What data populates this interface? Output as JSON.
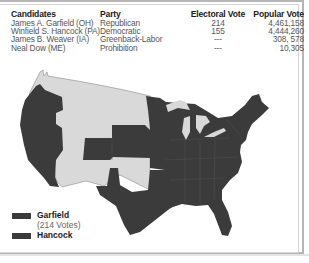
{
  "table": {
    "headers": [
      "Candidates",
      "Party",
      "Electoral Vote",
      "Popular Vote"
    ],
    "rows": [
      {
        "candidate": "James A. Garfield (OH)",
        "party": "Republican",
        "electoral_vote": "214",
        "popular_vote": "4,461,158"
      },
      {
        "candidate": "Winfield S. Hancock (PA)",
        "party": "Democratic",
        "electoral_vote": "155",
        "popular_vote": "4,444,260"
      },
      {
        "candidate": "James B. Weaver (IA)",
        "party": "Greenback-Labor",
        "electoral_vote": "---",
        "popular_vote": "308, 578"
      },
      {
        "candidate": "Neal Dow (ME)",
        "party": "Prohibition",
        "electoral_vote": "---",
        "popular_vote": "10,305"
      }
    ]
  },
  "legend": {
    "items": [
      {
        "label": "Garfield",
        "sublabel": "(214 Votes)",
        "color": "#3a3a3a"
      },
      {
        "label": "Hancock",
        "sublabel": "",
        "color": "#3a3a3a"
      }
    ]
  },
  "map": {
    "state_color": "#3b3b3b",
    "territory_color": "#d9d9d9",
    "lake_color": "#d9d9d9",
    "border_color": "#555555"
  }
}
